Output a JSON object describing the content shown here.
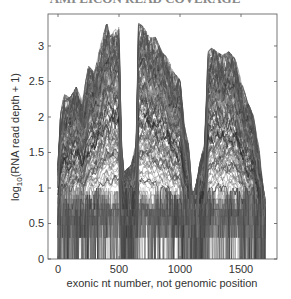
{
  "chart_data": {
    "type": "line",
    "title": "",
    "xlabel": "exonic nt number, not genomic position",
    "ylabel_prefix": "log",
    "ylabel_sub": "10",
    "ylabel_suffix": "(RNA read depth + 1)",
    "xlim": [
      -82,
      1795
    ],
    "ylim": [
      0,
      3.45
    ],
    "xticks": [
      0,
      500,
      1000,
      1500
    ],
    "xtick_labels": [
      "0",
      "500",
      "1000",
      "1500"
    ],
    "yticks": [
      0,
      0.5,
      1,
      1.5,
      2,
      2.5,
      3
    ],
    "ytick_labels": [
      "0",
      "0.5",
      "1",
      "1.5",
      "2",
      "2.5",
      "3"
    ],
    "grid": false,
    "legend": null,
    "series_count_estimate": 150,
    "data_extent_x": [
      0,
      1700
    ],
    "envelope_max": {
      "x": [
        0,
        20,
        50,
        100,
        150,
        200,
        250,
        300,
        350,
        400,
        430,
        460,
        500,
        520,
        540,
        600,
        640,
        660,
        700,
        750,
        800,
        850,
        900,
        950,
        1000,
        1040,
        1070,
        1100,
        1130,
        1160,
        1200,
        1230,
        1260,
        1300,
        1350,
        1400,
        1450,
        1500,
        1550,
        1600,
        1650,
        1680,
        1700
      ],
      "y": [
        1.3,
        2.0,
        2.3,
        2.25,
        2.4,
        2.2,
        2.7,
        2.6,
        3.0,
        3.3,
        3.1,
        3.2,
        3.25,
        1.6,
        1.2,
        1.3,
        1.6,
        3.3,
        3.25,
        3.1,
        3.1,
        2.9,
        2.8,
        2.6,
        2.5,
        1.8,
        1.6,
        0.9,
        1.0,
        1.3,
        1.6,
        2.9,
        2.95,
        2.9,
        2.85,
        2.9,
        2.8,
        2.5,
        2.2,
        2.0,
        1.5,
        1.0,
        0.8
      ]
    },
    "quantized_levels": [
      0,
      0.301,
      0.477,
      0.602,
      0.699,
      0.778,
      0.845,
      0.903,
      0.954,
      1.0
    ],
    "line_color": "#3a3a3a"
  },
  "page": {
    "clipped_title_text": "AMPLICON READ COVERAGE"
  }
}
